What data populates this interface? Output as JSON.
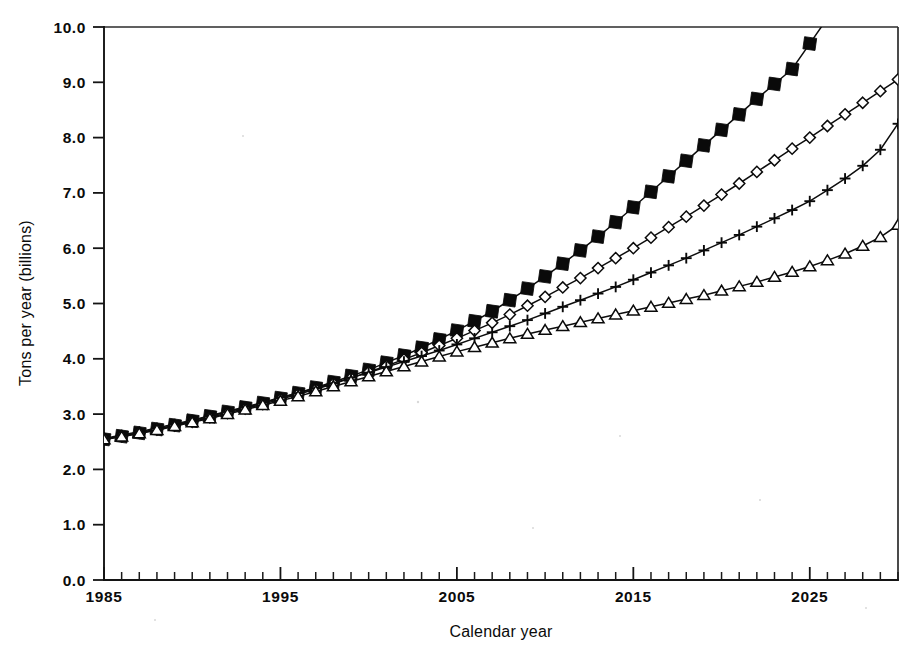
{
  "chart_data": {
    "type": "line",
    "title": "",
    "subtitle": "",
    "xlabel": "Calendar year",
    "ylabel": "Tons per year (billions)",
    "xlim": [
      1985,
      2030
    ],
    "ylim": [
      0.0,
      10.0
    ],
    "grid": false,
    "legend_position": "none",
    "x_tick_labels": [
      "1985",
      "1995",
      "2005",
      "2015",
      "2025"
    ],
    "x_tick_values": [
      1985,
      1995,
      2005,
      2015,
      2025
    ],
    "x_minor_tick_interval": 1,
    "y_tick_labels": [
      "0.0",
      "1.0",
      "2.0",
      "3.0",
      "4.0",
      "5.0",
      "6.0",
      "7.0",
      "8.0",
      "9.0",
      "10.0"
    ],
    "y_tick_values": [
      0.0,
      1.0,
      2.0,
      3.0,
      4.0,
      5.0,
      6.0,
      7.0,
      8.0,
      9.0,
      10.0
    ],
    "x": [
      1985,
      1986,
      1987,
      1988,
      1989,
      1990,
      1991,
      1992,
      1993,
      1994,
      1995,
      1996,
      1997,
      1998,
      1999,
      2000,
      2001,
      2002,
      2003,
      2004,
      2005,
      2006,
      2007,
      2008,
      2009,
      2010,
      2011,
      2012,
      2013,
      2014,
      2015,
      2016,
      2017,
      2018,
      2019,
      2020,
      2021,
      2022,
      2023,
      2024,
      2025,
      2026,
      2027,
      2028,
      2029,
      2030
    ],
    "series": [
      {
        "name": "series-filled-square",
        "marker": "filled-square",
        "values": [
          2.55,
          2.6,
          2.66,
          2.73,
          2.8,
          2.88,
          2.96,
          3.04,
          3.12,
          3.2,
          3.29,
          3.38,
          3.48,
          3.58,
          3.69,
          3.8,
          3.93,
          4.06,
          4.2,
          4.35,
          4.51,
          4.68,
          4.86,
          5.06,
          5.27,
          5.49,
          5.72,
          5.96,
          6.21,
          6.47,
          6.74,
          7.02,
          7.3,
          7.58,
          7.86,
          8.14,
          8.42,
          8.7,
          8.97,
          9.24,
          9.7,
          null,
          null,
          null,
          null,
          null
        ],
        "clipped_at_top": true,
        "clip_year": 2026,
        "clip_value": 10.0
      },
      {
        "name": "series-open-diamond",
        "marker": "open-diamond",
        "values": [
          2.55,
          2.6,
          2.66,
          2.72,
          2.79,
          2.86,
          2.94,
          3.02,
          3.1,
          3.18,
          3.27,
          3.36,
          3.45,
          3.55,
          3.65,
          3.76,
          3.87,
          3.99,
          4.11,
          4.24,
          4.37,
          4.51,
          4.65,
          4.8,
          4.96,
          5.12,
          5.29,
          5.46,
          5.64,
          5.82,
          6.0,
          6.19,
          6.38,
          6.57,
          6.77,
          6.97,
          7.17,
          7.38,
          7.59,
          7.8,
          8.0,
          8.21,
          8.42,
          8.63,
          8.84,
          9.05
        ]
      },
      {
        "name": "series-plus",
        "marker": "plus",
        "values": [
          2.56,
          2.62,
          2.68,
          2.75,
          2.82,
          2.89,
          2.97,
          3.05,
          3.13,
          3.21,
          3.3,
          3.38,
          3.47,
          3.56,
          3.66,
          3.75,
          3.85,
          3.95,
          4.05,
          4.15,
          4.26,
          4.37,
          4.48,
          4.59,
          4.7,
          4.82,
          4.94,
          5.06,
          5.18,
          5.3,
          5.43,
          5.56,
          5.69,
          5.82,
          5.96,
          6.1,
          6.24,
          6.39,
          6.54,
          6.69,
          6.85,
          7.05,
          7.26,
          7.49,
          7.78,
          8.25
        ]
      },
      {
        "name": "series-open-triangle",
        "marker": "open-triangle",
        "values": [
          2.54,
          2.59,
          2.65,
          2.71,
          2.78,
          2.85,
          2.92,
          3.0,
          3.08,
          3.16,
          3.24,
          3.32,
          3.41,
          3.5,
          3.59,
          3.68,
          3.77,
          3.86,
          3.95,
          4.04,
          4.13,
          4.21,
          4.29,
          4.37,
          4.45,
          4.52,
          4.59,
          4.66,
          4.73,
          4.8,
          4.87,
          4.94,
          5.01,
          5.08,
          5.15,
          5.23,
          5.31,
          5.39,
          5.48,
          5.57,
          5.67,
          5.78,
          5.9,
          6.04,
          6.2,
          6.42
        ]
      }
    ]
  }
}
